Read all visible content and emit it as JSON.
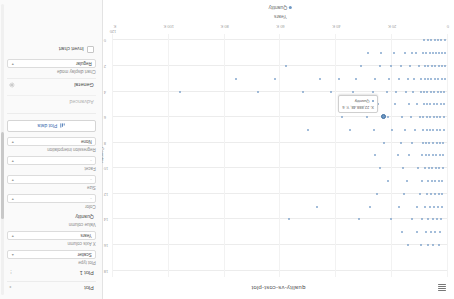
{
  "chart": {
    "title": "quality-vs-cost-plot",
    "menu_icon": "hamburger-icon",
    "legend_label": "Quantity",
    "tooltip": {
      "line1": "X: 22,888.48, Y: 6",
      "line2": "Quantity"
    }
  },
  "chart_data": {
    "type": "scatter",
    "title": "quality-vs-cost-plot",
    "xlabel": "Years",
    "ylabel": "Country",
    "legend": [
      "Quantity"
    ],
    "legend_position": "bottom",
    "grid": true,
    "xlim": [
      0,
      120000
    ],
    "x_ticks": [
      0,
      20000,
      40000,
      60000,
      80000,
      100000,
      120000
    ],
    "x_tick_labels": [
      "0",
      "20 K",
      "40 K",
      "60 K",
      "80 K",
      "100 K",
      "120 K"
    ],
    "y_ticks": [
      0,
      2,
      4,
      6,
      8,
      10,
      12,
      14,
      16,
      18
    ],
    "y_tick_labels": [
      "0",
      "2",
      "4",
      "6",
      "8",
      "10",
      "12",
      "14",
      "16",
      "18"
    ],
    "ylim": [
      -0.5,
      18.5
    ],
    "marker_color": "#6f98c4",
    "series": [
      {
        "name": "Quantity",
        "points": [
          {
            "x": 1200,
            "y": 0
          },
          {
            "x": 2400,
            "y": 0
          },
          {
            "x": 3600,
            "y": 0
          },
          {
            "x": 4800,
            "y": 0
          },
          {
            "x": 6100,
            "y": 0
          },
          {
            "x": 7300,
            "y": 0
          },
          {
            "x": 8500,
            "y": 0
          },
          {
            "x": 900,
            "y": 1
          },
          {
            "x": 2000,
            "y": 1
          },
          {
            "x": 3100,
            "y": 1
          },
          {
            "x": 4300,
            "y": 1
          },
          {
            "x": 5400,
            "y": 1
          },
          {
            "x": 6600,
            "y": 1
          },
          {
            "x": 7800,
            "y": 1
          },
          {
            "x": 9000,
            "y": 1
          },
          {
            "x": 11500,
            "y": 1
          },
          {
            "x": 13000,
            "y": 1
          },
          {
            "x": 15400,
            "y": 1
          },
          {
            "x": 19500,
            "y": 1
          },
          {
            "x": 24000,
            "y": 1
          },
          {
            "x": 28500,
            "y": 1
          },
          {
            "x": 1000,
            "y": 2
          },
          {
            "x": 2200,
            "y": 2
          },
          {
            "x": 3400,
            "y": 2
          },
          {
            "x": 4600,
            "y": 2
          },
          {
            "x": 5800,
            "y": 2
          },
          {
            "x": 7000,
            "y": 2
          },
          {
            "x": 8200,
            "y": 2
          },
          {
            "x": 10500,
            "y": 2
          },
          {
            "x": 13500,
            "y": 2
          },
          {
            "x": 16800,
            "y": 2
          },
          {
            "x": 20500,
            "y": 2
          },
          {
            "x": 24500,
            "y": 2
          },
          {
            "x": 31000,
            "y": 2
          },
          {
            "x": 58000,
            "y": 2
          },
          {
            "x": 1100,
            "y": 3
          },
          {
            "x": 2300,
            "y": 3
          },
          {
            "x": 3500,
            "y": 3
          },
          {
            "x": 4700,
            "y": 3
          },
          {
            "x": 6000,
            "y": 3
          },
          {
            "x": 7200,
            "y": 3
          },
          {
            "x": 8400,
            "y": 3
          },
          {
            "x": 9600,
            "y": 3
          },
          {
            "x": 12000,
            "y": 3
          },
          {
            "x": 14500,
            "y": 3
          },
          {
            "x": 17500,
            "y": 3
          },
          {
            "x": 21000,
            "y": 3
          },
          {
            "x": 26000,
            "y": 3
          },
          {
            "x": 33000,
            "y": 3
          },
          {
            "x": 39000,
            "y": 3
          },
          {
            "x": 46000,
            "y": 3
          },
          {
            "x": 62000,
            "y": 3
          },
          {
            "x": 76000,
            "y": 3
          },
          {
            "x": 1300,
            "y": 4
          },
          {
            "x": 2500,
            "y": 4
          },
          {
            "x": 3700,
            "y": 4
          },
          {
            "x": 4900,
            "y": 4
          },
          {
            "x": 6200,
            "y": 4
          },
          {
            "x": 7400,
            "y": 4
          },
          {
            "x": 8600,
            "y": 4
          },
          {
            "x": 9800,
            "y": 4
          },
          {
            "x": 12500,
            "y": 4
          },
          {
            "x": 15000,
            "y": 4
          },
          {
            "x": 18500,
            "y": 4
          },
          {
            "x": 22000,
            "y": 4
          },
          {
            "x": 27000,
            "y": 4
          },
          {
            "x": 34000,
            "y": 4
          },
          {
            "x": 42000,
            "y": 4
          },
          {
            "x": 52000,
            "y": 4
          },
          {
            "x": 68000,
            "y": 4
          },
          {
            "x": 96000,
            "y": 4
          },
          {
            "x": 1400,
            "y": 5
          },
          {
            "x": 2600,
            "y": 5
          },
          {
            "x": 3800,
            "y": 5
          },
          {
            "x": 5000,
            "y": 5
          },
          {
            "x": 6300,
            "y": 5
          },
          {
            "x": 7500,
            "y": 5
          },
          {
            "x": 8700,
            "y": 5
          },
          {
            "x": 11000,
            "y": 5
          },
          {
            "x": 14000,
            "y": 5
          },
          {
            "x": 19000,
            "y": 5
          },
          {
            "x": 25000,
            "y": 5
          },
          {
            "x": 30000,
            "y": 5
          },
          {
            "x": 36000,
            "y": 5
          },
          {
            "x": 1500,
            "y": 6
          },
          {
            "x": 2700,
            "y": 6
          },
          {
            "x": 3900,
            "y": 6
          },
          {
            "x": 5100,
            "y": 6
          },
          {
            "x": 6400,
            "y": 6
          },
          {
            "x": 7600,
            "y": 6
          },
          {
            "x": 8800,
            "y": 6
          },
          {
            "x": 10000,
            "y": 6
          },
          {
            "x": 13200,
            "y": 6
          },
          {
            "x": 16500,
            "y": 6
          },
          {
            "x": 21500,
            "y": 6
          },
          {
            "x": 29000,
            "y": 6
          },
          {
            "x": 38000,
            "y": 6
          },
          {
            "x": 22888,
            "y": 6
          },
          {
            "x": 1600,
            "y": 7
          },
          {
            "x": 2800,
            "y": 7
          },
          {
            "x": 4000,
            "y": 7
          },
          {
            "x": 5200,
            "y": 7
          },
          {
            "x": 6500,
            "y": 7
          },
          {
            "x": 7700,
            "y": 7
          },
          {
            "x": 8900,
            "y": 7
          },
          {
            "x": 11800,
            "y": 7
          },
          {
            "x": 15500,
            "y": 7
          },
          {
            "x": 20000,
            "y": 7
          },
          {
            "x": 26500,
            "y": 7
          },
          {
            "x": 35000,
            "y": 7
          },
          {
            "x": 50000,
            "y": 7
          },
          {
            "x": 1700,
            "y": 8
          },
          {
            "x": 2900,
            "y": 8
          },
          {
            "x": 4100,
            "y": 8
          },
          {
            "x": 5300,
            "y": 8
          },
          {
            "x": 6700,
            "y": 8
          },
          {
            "x": 7900,
            "y": 8
          },
          {
            "x": 9100,
            "y": 8
          },
          {
            "x": 12800,
            "y": 8
          },
          {
            "x": 17000,
            "y": 8
          },
          {
            "x": 23000,
            "y": 8
          },
          {
            "x": 1800,
            "y": 9
          },
          {
            "x": 3000,
            "y": 9
          },
          {
            "x": 4200,
            "y": 9
          },
          {
            "x": 5500,
            "y": 9
          },
          {
            "x": 6800,
            "y": 9
          },
          {
            "x": 8000,
            "y": 9
          },
          {
            "x": 9200,
            "y": 9
          },
          {
            "x": 13800,
            "y": 9
          },
          {
            "x": 18000,
            "y": 9
          },
          {
            "x": 26000,
            "y": 9
          },
          {
            "x": 1900,
            "y": 10
          },
          {
            "x": 3200,
            "y": 10
          },
          {
            "x": 4400,
            "y": 10
          },
          {
            "x": 5600,
            "y": 10
          },
          {
            "x": 6900,
            "y": 10
          },
          {
            "x": 8100,
            "y": 10
          },
          {
            "x": 10800,
            "y": 10
          },
          {
            "x": 16000,
            "y": 10
          },
          {
            "x": 24500,
            "y": 10
          },
          {
            "x": 2100,
            "y": 11
          },
          {
            "x": 3300,
            "y": 11
          },
          {
            "x": 4500,
            "y": 11
          },
          {
            "x": 5700,
            "y": 11
          },
          {
            "x": 7100,
            "y": 11
          },
          {
            "x": 9400,
            "y": 11
          },
          {
            "x": 14800,
            "y": 11
          },
          {
            "x": 21500,
            "y": 11
          },
          {
            "x": 2000,
            "y": 12
          },
          {
            "x": 3400,
            "y": 12
          },
          {
            "x": 4600,
            "y": 12
          },
          {
            "x": 6000,
            "y": 12
          },
          {
            "x": 7600,
            "y": 12
          },
          {
            "x": 10200,
            "y": 12
          },
          {
            "x": 15800,
            "y": 12
          },
          {
            "x": 25500,
            "y": 12
          },
          {
            "x": 2300,
            "y": 13
          },
          {
            "x": 3600,
            "y": 13
          },
          {
            "x": 4900,
            "y": 13
          },
          {
            "x": 6300,
            "y": 13
          },
          {
            "x": 8300,
            "y": 13
          },
          {
            "x": 11200,
            "y": 13
          },
          {
            "x": 17500,
            "y": 13
          },
          {
            "x": 28000,
            "y": 13
          },
          {
            "x": 47000,
            "y": 13
          },
          {
            "x": 2600,
            "y": 14
          },
          {
            "x": 4000,
            "y": 14
          },
          {
            "x": 5400,
            "y": 14
          },
          {
            "x": 7000,
            "y": 14
          },
          {
            "x": 9200,
            "y": 14
          },
          {
            "x": 13000,
            "y": 14
          },
          {
            "x": 20500,
            "y": 14
          },
          {
            "x": 32000,
            "y": 14
          },
          {
            "x": 57000,
            "y": 14
          },
          {
            "x": 3000,
            "y": 15
          },
          {
            "x": 4600,
            "y": 15
          },
          {
            "x": 6200,
            "y": 15
          },
          {
            "x": 8000,
            "y": 15
          },
          {
            "x": 11000,
            "y": 15
          },
          {
            "x": 16500,
            "y": 15
          },
          {
            "x": 3400,
            "y": 16
          },
          {
            "x": 5200,
            "y": 16
          },
          {
            "x": 7200,
            "y": 16
          },
          {
            "x": 9800,
            "y": 16
          },
          {
            "x": 14500,
            "y": 16
          }
        ]
      }
    ]
  },
  "panel": {
    "sections": {
      "plot": "Plot",
      "general": "General",
      "advanced": "Advanced"
    },
    "icons": {
      "collapse": "chevron-icon",
      "gear": "gear-icon",
      "plot": "chart-icon"
    },
    "fields": [
      {
        "label": "Plot 1",
        "value": "",
        "kind": "header"
      },
      {
        "label": "Plot type",
        "value": "Scatter",
        "kind": "select"
      },
      {
        "label": "X Axis column",
        "value": "Years",
        "kind": "select"
      },
      {
        "label": "Value column",
        "value": "Quantity",
        "kind": "header-label"
      },
      {
        "label": "Color",
        "value": "-",
        "kind": "select"
      },
      {
        "label": "Size",
        "value": "-",
        "kind": "select"
      },
      {
        "label": "Facet",
        "value": "-",
        "kind": "select"
      },
      {
        "label": "Regression interpolation",
        "value": "None",
        "kind": "select"
      }
    ],
    "plot_data_button": "Plot data",
    "chart_display_mode_label": "Chart display mode",
    "chart_display_mode_value": "Regular",
    "invert_chart_label": "Invert chart"
  }
}
